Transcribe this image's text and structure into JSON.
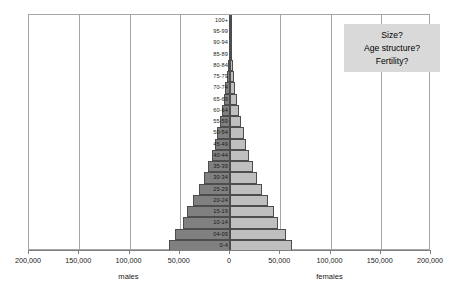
{
  "chart_data": {
    "type": "bar",
    "title": "",
    "subtitle": "",
    "orientation": "horizontal-diverging",
    "xlabel": "",
    "ylabel": "",
    "xlim": [
      -200000,
      200000
    ],
    "x_tick_values": [
      -200000,
      -150000,
      -100000,
      -50000,
      0,
      50000,
      100000,
      150000,
      200000
    ],
    "x_tick_labels": [
      "200,000",
      "150,000",
      "100,000",
      "50,000",
      "0",
      "50,000",
      "100,000",
      "150,000",
      "200,000"
    ],
    "gridlines_at": [
      -150000,
      -100000,
      -50000,
      0,
      50000,
      100000,
      150000
    ],
    "grid": true,
    "legend_position": "none",
    "side_labels": {
      "left": "males",
      "right": "females"
    },
    "categories": [
      "0-4",
      "04-09",
      "10-14",
      "15-19",
      "20-24",
      "25-29",
      "30-34",
      "35-39",
      "40-44",
      "45-49",
      "50-54",
      "55-59",
      "60-64",
      "65-69",
      "70-74",
      "75-79",
      "80-84",
      "85-89",
      "90-94",
      "95-99",
      "100+"
    ],
    "series": [
      {
        "name": "males",
        "color": "#808080",
        "values": [
          61000,
          55000,
          47000,
          43000,
          37000,
          31000,
          26000,
          22000,
          18000,
          15000,
          12500,
          10000,
          8000,
          6200,
          4600,
          3200,
          2000,
          1100,
          500,
          200,
          60
        ]
      },
      {
        "name": "females",
        "color": "#bfbfbf",
        "values": [
          62000,
          56000,
          48000,
          44000,
          38000,
          32000,
          27000,
          23000,
          19000,
          16000,
          13500,
          11000,
          9000,
          7000,
          5400,
          3900,
          2600,
          1500,
          700,
          280,
          80
        ]
      }
    ]
  },
  "callout": {
    "name": "question-callout",
    "lines": [
      "Size?",
      "Age structure?",
      "Fertility?"
    ],
    "background": "#d9d9d9"
  },
  "axis": {
    "left_label": "males",
    "right_label": "females"
  },
  "colors": {
    "male_bar": "#808080",
    "female_bar": "#bfbfbf",
    "bar_border": "#4d4d4d",
    "gridline": "#a6a6a6",
    "axis_line": "#808080",
    "callout_bg": "#d9d9d9",
    "text": "#1a1a1a"
  }
}
